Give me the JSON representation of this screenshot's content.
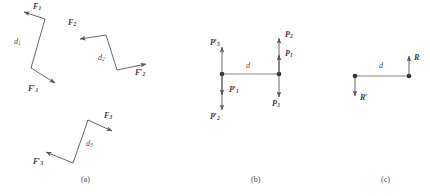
{
  "figure": {
    "stroke_color": "#555555",
    "label_color": "#3a3a3a",
    "caption_color": "#4a4a4a",
    "background": "#ffffff"
  },
  "panel_a": {
    "caption": "(a)",
    "couple1": {
      "force_label": "F",
      "force_sub": "1",
      "force_prime_label": "F",
      "force_prime_sub": "1",
      "prime_mark": "′",
      "distance_label": "d",
      "distance_sub": "1"
    },
    "couple2": {
      "force_label": "F",
      "force_sub": "2",
      "force_prime_label": "F",
      "force_prime_sub": "2",
      "prime_mark": "′",
      "distance_label": "d",
      "distance_sub": "2"
    },
    "couple3": {
      "force_label": "F",
      "force_sub": "3",
      "force_prime_label": "F",
      "force_prime_sub": "3",
      "prime_mark": "′",
      "distance_label": "d",
      "distance_sub": "3"
    }
  },
  "panel_b": {
    "caption": "(b)",
    "distance_label": "d",
    "forces": [
      {
        "name": "P",
        "sub": "3",
        "prime": "′"
      },
      {
        "name": "P",
        "sub": "1",
        "prime": "′"
      },
      {
        "name": "P",
        "sub": "2",
        "prime": "′"
      },
      {
        "name": "P",
        "sub": "2",
        "prime": ""
      },
      {
        "name": "P",
        "sub": "1",
        "prime": ""
      },
      {
        "name": "P",
        "sub": "3",
        "prime": ""
      }
    ]
  },
  "panel_c": {
    "caption": "(c)",
    "distance_label": "d",
    "resultant_label": "R",
    "resultant_prime_label": "R",
    "prime_mark": "′"
  }
}
